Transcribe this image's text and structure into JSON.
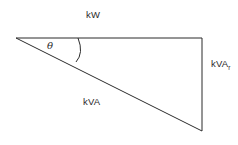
{
  "diagram": {
    "name": "power-triangle",
    "background_color": "#ffffff",
    "line_color": "#2b2b2b",
    "text_color": "#2b2b2b",
    "vertices": {
      "left_apex": [
        16,
        38
      ],
      "top_right": [
        202,
        38
      ],
      "bottom_right": [
        202,
        131
      ]
    },
    "sides": {
      "adjacent": {
        "label": "kW",
        "from": [
          16,
          38
        ],
        "to": [
          202,
          38
        ]
      },
      "opposite": {
        "label_main": "kVA",
        "label_subscript": "r",
        "from": [
          202,
          38
        ],
        "to": [
          202,
          131
        ]
      },
      "hypotenuse": {
        "label": "kVA",
        "from": [
          16,
          38
        ],
        "to": [
          202,
          131
        ]
      }
    },
    "angle": {
      "symbol": "θ",
      "arc_from": [
        78,
        38
      ],
      "arc_to": [
        76,
        62
      ]
    }
  }
}
